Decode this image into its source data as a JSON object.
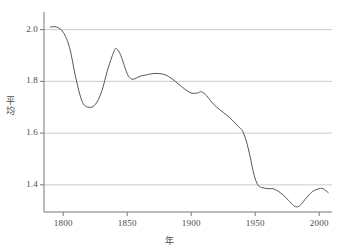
{
  "chart_data": {
    "type": "line",
    "title": "",
    "subtitle": "",
    "xlabel": "年",
    "ylabel": "平均",
    "xlim": [
      1785,
      2010
    ],
    "ylim": [
      1.295,
      2.045
    ],
    "grid": true,
    "grid_axis": "y",
    "legend": false,
    "legend_position": "none",
    "line_color": "#555555",
    "grid_color": "#cccccc",
    "axis_color": "#777777",
    "text_color": "#4a4a4a",
    "background": "#ffffff",
    "xticks": [
      1800,
      1850,
      1900,
      1950,
      2000
    ],
    "xtick_labels": [
      "1800",
      "1850",
      "1900",
      "1950",
      "2000"
    ],
    "yticks": [
      1.4,
      1.6,
      1.8,
      2.0
    ],
    "ytick_labels": [
      "1.4",
      "1.6",
      "1.8",
      "2.0"
    ],
    "series": [
      {
        "name": "平均",
        "x": [
          1790,
          1795,
          1800,
          1805,
          1810,
          1815,
          1820,
          1825,
          1830,
          1835,
          1840,
          1842,
          1845,
          1850,
          1853,
          1856,
          1860,
          1865,
          1870,
          1875,
          1880,
          1885,
          1890,
          1895,
          1900,
          1905,
          1908,
          1912,
          1916,
          1920,
          1925,
          1930,
          1935,
          1938,
          1940,
          1943,
          1946,
          1949,
          1952,
          1955,
          1960,
          1964,
          1968,
          1972,
          1976,
          1980,
          1983,
          1986,
          1990,
          1995,
          2000,
          2003,
          2007
        ],
        "y": [
          2.01,
          2.01,
          1.99,
          1.93,
          1.81,
          1.72,
          1.7,
          1.71,
          1.76,
          1.85,
          1.92,
          1.925,
          1.9,
          1.83,
          1.81,
          1.81,
          1.82,
          1.825,
          1.83,
          1.83,
          1.825,
          1.81,
          1.79,
          1.77,
          1.755,
          1.755,
          1.76,
          1.745,
          1.72,
          1.7,
          1.68,
          1.66,
          1.635,
          1.62,
          1.61,
          1.57,
          1.51,
          1.44,
          1.4,
          1.39,
          1.385,
          1.385,
          1.375,
          1.36,
          1.34,
          1.32,
          1.315,
          1.325,
          1.35,
          1.375,
          1.385,
          1.385,
          1.37
        ],
        "color": "#555555"
      }
    ]
  }
}
